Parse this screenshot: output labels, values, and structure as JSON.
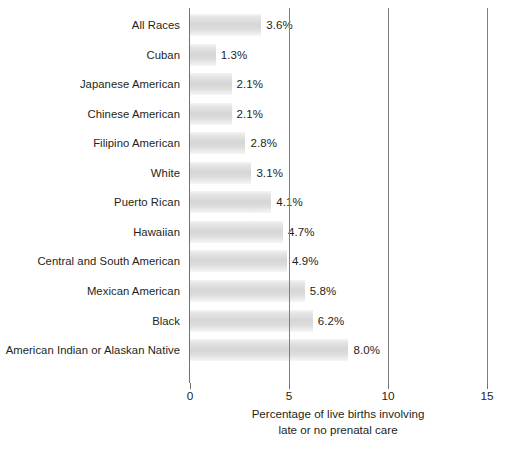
{
  "chart_data": {
    "type": "bar",
    "orientation": "horizontal",
    "title": "",
    "xlabel_lines": [
      "Percentage of live births involving",
      "late or no prenatal care"
    ],
    "ylabel": "",
    "xlim": [
      0,
      15
    ],
    "xticks": [
      0,
      5,
      10,
      15
    ],
    "xtick_labels": [
      "0",
      "5",
      "10",
      "15"
    ],
    "grid": "vertical gridlines at 5, 10, 15",
    "legend": "none",
    "value_suffix": "%",
    "categories": [
      "All Races",
      "Cuban",
      "Japanese American",
      "Chinese American",
      "Filipino American",
      "White",
      "Puerto Rican",
      "Hawaiian",
      "Central and South American",
      "Mexican American",
      "Black",
      "American Indian or Alaskan Native"
    ],
    "values": [
      3.6,
      1.3,
      2.1,
      2.1,
      2.8,
      3.1,
      4.1,
      4.7,
      4.9,
      5.8,
      6.2,
      8.0
    ],
    "value_labels": [
      "3.6%",
      "1.3%",
      "2.1%",
      "2.1%",
      "2.8%",
      "3.1%",
      "4.1%",
      "4.7%",
      "4.9%",
      "5.8%",
      "6.2%",
      "8.0%"
    ],
    "bars": [
      {
        "category": "All Races",
        "value": 3.6,
        "label": "3.6%"
      },
      {
        "category": "Cuban",
        "value": 1.3,
        "label": "1.3%"
      },
      {
        "category": "Japanese American",
        "value": 2.1,
        "label": "2.1%"
      },
      {
        "category": "Chinese American",
        "value": 2.1,
        "label": "2.1%"
      },
      {
        "category": "Filipino American",
        "value": 2.8,
        "label": "2.8%"
      },
      {
        "category": "White",
        "value": 3.1,
        "label": "3.1%"
      },
      {
        "category": "Puerto Rican",
        "value": 4.1,
        "label": "4.1%"
      },
      {
        "category": "Hawaiian",
        "value": 4.7,
        "label": "4.7%"
      },
      {
        "category": "Central and South American",
        "value": 4.9,
        "label": "4.9%"
      },
      {
        "category": "Mexican American",
        "value": 5.8,
        "label": "5.8%"
      },
      {
        "category": "Black",
        "value": 6.2,
        "label": "6.2%"
      },
      {
        "category": "American Indian or Alaskan Native",
        "value": 8.0,
        "label": "8.0%"
      }
    ],
    "colors": {
      "bar_fill_light": "#f4f4f4",
      "bar_fill_mid": "#d6d6d6",
      "axis": "#6f7175",
      "gridline": "#7d7f83",
      "text": "#231f20",
      "background": "#ffffff"
    }
  }
}
